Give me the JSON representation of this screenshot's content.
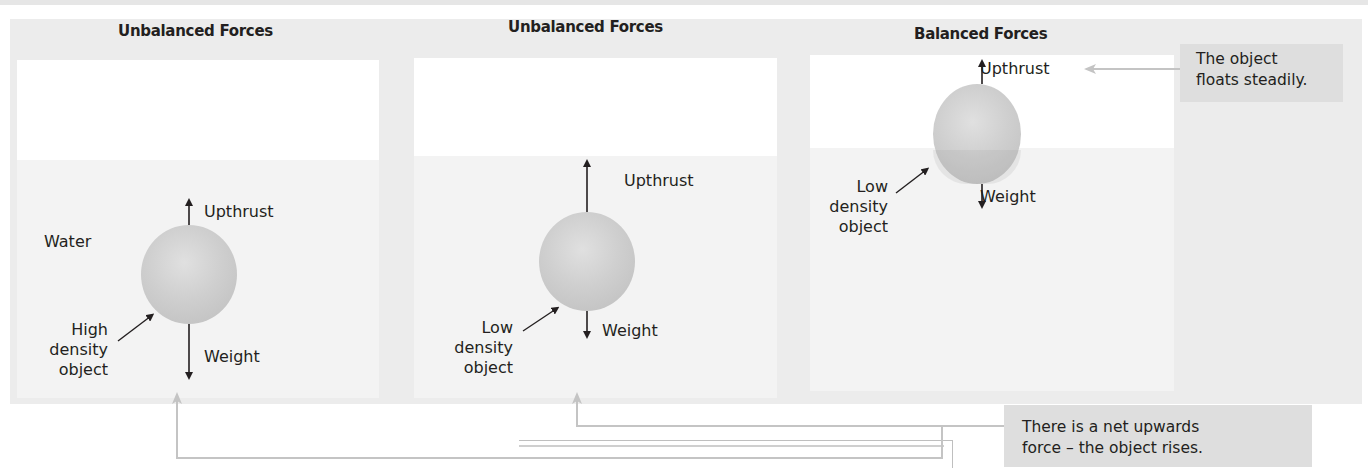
{
  "panels": [
    {
      "title": "Unbalanced Forces",
      "labels": {
        "medium": "Water",
        "upthrust": "Upthrust",
        "weight": "Weight",
        "object_line1": "High",
        "object_line2": "density",
        "object_line3": "object"
      },
      "object_density": "high",
      "state": "sinking"
    },
    {
      "title": "Unbalanced Forces",
      "labels": {
        "upthrust": "Upthrust",
        "weight": "Weight",
        "object_line1": "Low",
        "object_line2": "density",
        "object_line3": "object"
      },
      "object_density": "low",
      "state": "rising"
    },
    {
      "title": "Balanced Forces",
      "labels": {
        "upthrust": "Upthrust",
        "weight": "Weight",
        "object_line1": "Low",
        "object_line2": "density",
        "object_line3": "object"
      },
      "object_density": "low",
      "state": "floating"
    }
  ],
  "callouts": {
    "floats": {
      "line1": "The object",
      "line2": "floats steadily."
    },
    "rises": {
      "line1": "There is a net upwards",
      "line2": "force – the object rises."
    }
  },
  "colors": {
    "panel_bg": "#ececec",
    "tank_bg": "#ffffff",
    "water": "#f3f3f3",
    "sphere": "#cfcfcf",
    "callout_bg": "#dedede",
    "connector": "#c4c4c4",
    "arrow": "#231f20"
  },
  "icons": {
    "force_up": "arrow-up",
    "force_down": "arrow-down",
    "pointer": "arrow-diagonal"
  }
}
